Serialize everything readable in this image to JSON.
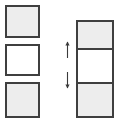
{
  "canvas": {
    "width": 118,
    "height": 125,
    "background": "#ffffff"
  },
  "style": {
    "border_color": "#3f3f3f",
    "border_width": 2,
    "fill_gray": "#ededed",
    "fill_white": "#ffffff",
    "arrow_color": "#3a3a3a"
  },
  "diagram": {
    "type": "schematic-box-stack",
    "left_column": {
      "name": "separated-boxes",
      "x": 5,
      "width": 35,
      "boxes": [
        {
          "label": "",
          "y": 5,
          "height": 33,
          "fill": "#ededed",
          "state": "filled"
        },
        {
          "label": "",
          "y": 44,
          "height": 32,
          "fill": "#ffffff",
          "state": "empty"
        },
        {
          "label": "",
          "y": 82,
          "height": 36,
          "fill": "#ededed",
          "state": "filled"
        }
      ]
    },
    "right_column": {
      "name": "joined-stack",
      "x": 76,
      "width": 38,
      "y": 20,
      "height": 98,
      "cells": [
        {
          "label": "",
          "y": 20,
          "height": 30,
          "fill": "#ededed",
          "state": "filled"
        },
        {
          "label": "",
          "y": 50,
          "height": 34,
          "fill": "#ffffff",
          "state": "empty"
        },
        {
          "label": "",
          "y": 84,
          "height": 34,
          "fill": "#ededed",
          "state": "filled"
        }
      ]
    },
    "markers": [
      {
        "name": "gap-arrow-upper",
        "x": 64,
        "y": 41,
        "width": 7,
        "height": 18,
        "direction": "up"
      },
      {
        "name": "gap-arrow-lower",
        "x": 64,
        "y": 71,
        "width": 7,
        "height": 18,
        "direction": "down"
      }
    ]
  }
}
